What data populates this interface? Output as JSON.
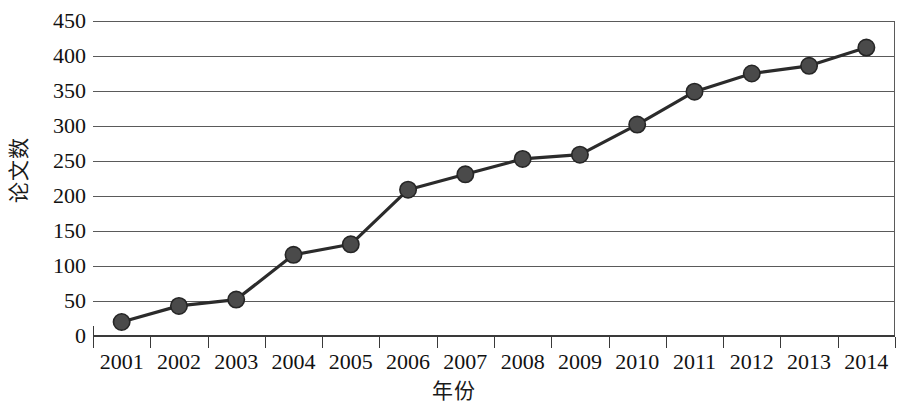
{
  "chart_data": {
    "type": "line",
    "title": "",
    "xlabel": "年份",
    "ylabel": "论文数",
    "categories": [
      "2001",
      "2002",
      "2003",
      "2004",
      "2005",
      "2006",
      "2007",
      "2008",
      "2009",
      "2010",
      "2011",
      "2012",
      "2013",
      "2014"
    ],
    "values": [
      20,
      43,
      52,
      116,
      131,
      209,
      231,
      253,
      259,
      302,
      349,
      375,
      386,
      412
    ],
    "series": [
      {
        "name": "论文数",
        "values": [
          20,
          43,
          52,
          116,
          131,
          209,
          231,
          253,
          259,
          302,
          349,
          375,
          386,
          412
        ]
      }
    ],
    "ylim": [
      0,
      450
    ],
    "yticks": [
      0,
      50,
      100,
      150,
      200,
      250,
      300,
      350,
      400,
      450
    ],
    "ytick_labels": [
      "0",
      "50",
      "100",
      "150",
      "200",
      "250",
      "300",
      "350",
      "400",
      "450"
    ],
    "grid": true,
    "legend": false,
    "legend_position": "none",
    "marker": "circle",
    "colors": {
      "line": "#2b2b2b",
      "marker_fill": "#4a4a4a",
      "marker_stroke": "#262626",
      "grid": "#5a5a5a",
      "axis": "#3a3a3a",
      "background": "#ffffff",
      "text": "#111111"
    }
  }
}
